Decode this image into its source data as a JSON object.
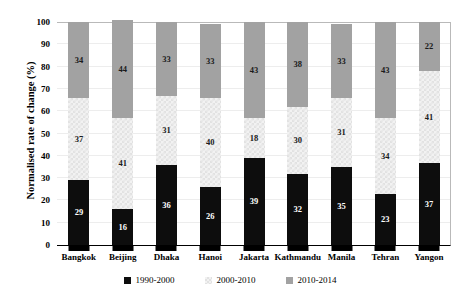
{
  "chart_data": {
    "type": "bar",
    "stacked": true,
    "title": "",
    "xlabel": "",
    "ylabel": "Normalised rate of change (%)",
    "ylim": [
      0,
      100
    ],
    "ytick_labels": [
      "0",
      "10",
      "20",
      "30",
      "40",
      "50",
      "60",
      "70",
      "80",
      "90",
      "100"
    ],
    "yticks": [
      0,
      10,
      20,
      30,
      40,
      50,
      60,
      70,
      80,
      90,
      100
    ],
    "grid": true,
    "legend_position": "bottom",
    "categories": [
      "Bangkok",
      "Beijing",
      "Dhaka",
      "Hanoi",
      "Jakarta",
      "Kathmandu",
      "Manila",
      "Tehran",
      "Yangon"
    ],
    "series": [
      {
        "name": "1990-2000",
        "color": "#0d0d0d",
        "values": [
          29,
          16,
          36,
          26,
          39,
          32,
          35,
          23,
          37
        ]
      },
      {
        "name": "2000-2010",
        "color": "#f2f2f2",
        "values": [
          37,
          41,
          31,
          40,
          18,
          30,
          31,
          34,
          41
        ]
      },
      {
        "name": "2010-2014",
        "color": "#a2a2a2",
        "values": [
          34,
          44,
          33,
          33,
          43,
          38,
          33,
          43,
          22
        ]
      }
    ]
  },
  "colors": {
    "series_1990_2000": "#0d0d0d",
    "series_2000_2010": "#f2f2f2",
    "series_2010_2014": "#a2a2a2",
    "axis": "#000000",
    "gridline": "#ededed",
    "background": "#ffffff"
  }
}
